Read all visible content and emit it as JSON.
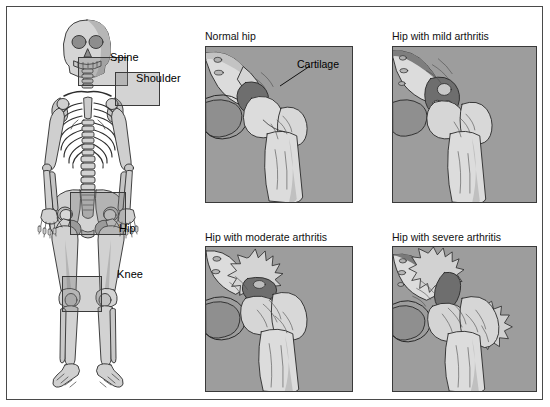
{
  "figure": {
    "border_color": "#4a4a4a",
    "background": "#ffffff"
  },
  "skeleton": {
    "name": "full-body-skeleton",
    "joint_labels": [
      {
        "id": "spine",
        "label": "Spine"
      },
      {
        "id": "shoulder",
        "label": "Shoulder"
      },
      {
        "id": "hip",
        "label": "Hip"
      },
      {
        "id": "knee",
        "label": "Knee"
      }
    ],
    "highlight_color": "rgba(120,120,120,.33)",
    "bone_fill": "#d7d7d7",
    "bone_shade": "#b4b4b4",
    "outline": "#2d2d2d"
  },
  "panels": [
    {
      "id": "normal-hip",
      "title": "Normal hip",
      "annotation": "Cartilage",
      "severity": "normal",
      "background": "#9d9d9d",
      "bone_color": "#dcdcdc",
      "cartilage_color": "#6e6e6e"
    },
    {
      "id": "mild-arthritis",
      "title": "Hip with mild arthritis",
      "annotation": "",
      "severity": "mild",
      "background": "#9d9d9d",
      "bone_color": "#dcdcdc",
      "cartilage_color": "#6e6e6e"
    },
    {
      "id": "moderate-arthritis",
      "title": "Hip with moderate arthritis",
      "annotation": "",
      "severity": "moderate",
      "background": "#9d9d9d",
      "bone_color": "#dcdcdc",
      "cartilage_color": "#6e6e6e"
    },
    {
      "id": "severe-arthritis",
      "title": "Hip with severe arthritis",
      "annotation": "",
      "severity": "severe",
      "background": "#9d9d9d",
      "bone_color": "#dcdcdc",
      "cartilage_color": "#6e6e6e"
    }
  ]
}
